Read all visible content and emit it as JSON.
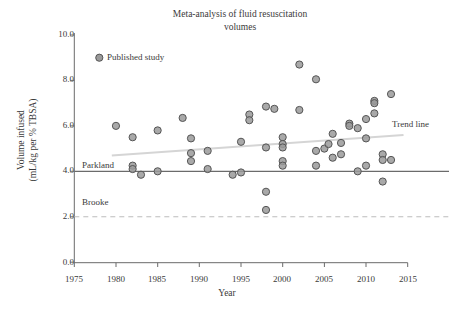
{
  "chart_data": {
    "type": "scatter",
    "title": "Meta-analysis of fluid resuscitation volumes",
    "title_line1": "Meta-analysis of fluid resuscitation",
    "title_line2": "volumes",
    "xlabel": "Year",
    "ylabel": "Volume infused",
    "ylabel_line1": "Volume infused",
    "ylabel_line2": "(mL/kg per % TBSA)",
    "xlim": [
      1975,
      2015
    ],
    "ylim": [
      0.0,
      10.0
    ],
    "xticks": [
      1975,
      1980,
      1985,
      1990,
      1995,
      2000,
      2005,
      2010,
      2015
    ],
    "xtick_labels": [
      "1975",
      "1980",
      "1985",
      "1990",
      "1995",
      "2000",
      "2005",
      "2010",
      "2015"
    ],
    "yticks": [
      0.0,
      2.0,
      4.0,
      6.0,
      8.0,
      10.0
    ],
    "ytick_labels": [
      "0.0",
      "2.0",
      "4.0",
      "6.0",
      "8.0",
      "10.0"
    ],
    "grid": false,
    "legend_position": "upper-left-inside",
    "series": [
      {
        "name": "Published study",
        "marker": "circle",
        "marker_fill": "#9a9a9a",
        "marker_edge": "#555555",
        "points": [
          {
            "x": 1980.0,
            "y": 6.0
          },
          {
            "x": 1982.0,
            "y": 5.5
          },
          {
            "x": 1982.0,
            "y": 4.25
          },
          {
            "x": 1982.0,
            "y": 4.1
          },
          {
            "x": 1983.0,
            "y": 3.85
          },
          {
            "x": 1985.0,
            "y": 5.8
          },
          {
            "x": 1985.0,
            "y": 4.0
          },
          {
            "x": 1988.0,
            "y": 6.35
          },
          {
            "x": 1989.0,
            "y": 5.45
          },
          {
            "x": 1989.0,
            "y": 4.8
          },
          {
            "x": 1989.0,
            "y": 4.45
          },
          {
            "x": 1991.0,
            "y": 4.9
          },
          {
            "x": 1991.0,
            "y": 4.1
          },
          {
            "x": 1994.0,
            "y": 3.85
          },
          {
            "x": 1995.0,
            "y": 5.3
          },
          {
            "x": 1995.0,
            "y": 3.95
          },
          {
            "x": 1996.0,
            "y": 6.5
          },
          {
            "x": 1996.0,
            "y": 6.25
          },
          {
            "x": 1998.0,
            "y": 6.85
          },
          {
            "x": 1998.0,
            "y": 5.05
          },
          {
            "x": 1998.0,
            "y": 3.1
          },
          {
            "x": 1998.0,
            "y": 2.3
          },
          {
            "x": 1999.0,
            "y": 6.75
          },
          {
            "x": 2000.0,
            "y": 5.5
          },
          {
            "x": 2000.0,
            "y": 5.2
          },
          {
            "x": 2000.0,
            "y": 5.05
          },
          {
            "x": 2000.0,
            "y": 4.45
          },
          {
            "x": 2000.0,
            "y": 4.25
          },
          {
            "x": 2002.0,
            "y": 8.7
          },
          {
            "x": 2002.0,
            "y": 6.7
          },
          {
            "x": 2004.0,
            "y": 8.05
          },
          {
            "x": 2004.0,
            "y": 4.9
          },
          {
            "x": 2004.0,
            "y": 4.25
          },
          {
            "x": 2005.0,
            "y": 5.0
          },
          {
            "x": 2005.5,
            "y": 5.2
          },
          {
            "x": 2006.0,
            "y": 5.65
          },
          {
            "x": 2006.0,
            "y": 4.6
          },
          {
            "x": 2007.0,
            "y": 5.25
          },
          {
            "x": 2007.0,
            "y": 4.75
          },
          {
            "x": 2008.0,
            "y": 6.1
          },
          {
            "x": 2008.0,
            "y": 6.0
          },
          {
            "x": 2009.0,
            "y": 5.9
          },
          {
            "x": 2009.0,
            "y": 4.0
          },
          {
            "x": 2010.0,
            "y": 6.3
          },
          {
            "x": 2010.0,
            "y": 5.45
          },
          {
            "x": 2010.0,
            "y": 4.25
          },
          {
            "x": 2011.0,
            "y": 7.1
          },
          {
            "x": 2011.0,
            "y": 7.0
          },
          {
            "x": 2011.0,
            "y": 6.55
          },
          {
            "x": 2012.0,
            "y": 4.75
          },
          {
            "x": 2012.0,
            "y": 4.5
          },
          {
            "x": 2012.0,
            "y": 3.55
          },
          {
            "x": 2013.0,
            "y": 7.4
          },
          {
            "x": 2013.0,
            "y": 4.5
          }
        ]
      }
    ],
    "reference_lines": [
      {
        "name": "Parkland",
        "label": "Parkland",
        "y": 4.0,
        "style": "solid",
        "color": "#6b6b6b"
      },
      {
        "name": "Brooke",
        "label": "Brooke",
        "y": 2.0,
        "style": "dashed",
        "color": "#bdbdbd"
      }
    ],
    "trend_line": {
      "label": "Trend line",
      "color": "#d5d5d5",
      "x_start": 1979.5,
      "y_start": 4.7,
      "x_end": 2014.5,
      "y_end": 5.6
    },
    "legend": {
      "label": "Published study",
      "marker_x": 1978.0,
      "marker_y": 9.0
    },
    "annotations": [
      {
        "name": "parkland-annotation",
        "text": "Parkland",
        "x": 1976.0,
        "y": 4.45
      },
      {
        "name": "brooke-annotation",
        "text": "Brooke",
        "x": 1976.0,
        "y": 2.45
      },
      {
        "name": "trend-annotation",
        "text": "Trend line",
        "x": 2013.0,
        "y": 5.95
      }
    ]
  }
}
